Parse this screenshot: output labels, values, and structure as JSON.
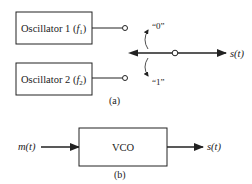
{
  "diagram_a": {
    "caption": "(a)",
    "oscillator1": {
      "label": "Oscillator 1 (",
      "freq": "f",
      "sub": "1",
      "close": ")"
    },
    "oscillator2": {
      "label": "Oscillator 2 (",
      "freq": "f",
      "sub": "2",
      "close": ")"
    },
    "switch_label_top": "“0”",
    "switch_label_bottom": "“1”",
    "output_label": "s(t)"
  },
  "diagram_b": {
    "caption": "(b)",
    "input_label": "m(t)",
    "block_label": "VCO",
    "output_label": "s(t)"
  },
  "colors": {
    "line": "#222222",
    "background": "#ffffff"
  }
}
